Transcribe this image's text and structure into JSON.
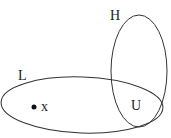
{
  "diagram": {
    "sets": [
      {
        "name": "L",
        "label": "L"
      },
      {
        "name": "H",
        "label": "H"
      }
    ],
    "intersection_label": "U",
    "point_label": "x",
    "stroke_color": "#333333"
  }
}
